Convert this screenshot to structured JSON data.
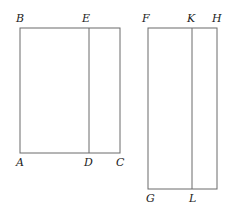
{
  "diagram": {
    "colors": {
      "line": "#6a6a6a",
      "label": "#222222",
      "background": "#ffffff"
    },
    "figure_left": {
      "rectangle": {
        "x1": 20,
        "y1": 28,
        "x2": 120,
        "y2": 153
      },
      "divider": {
        "x": 89,
        "y1": 28,
        "y2": 153
      },
      "labels": {
        "B": "B",
        "E": "E",
        "A": "A",
        "D": "D",
        "C": "C"
      }
    },
    "figure_right": {
      "rectangle": {
        "x1": 148,
        "y1": 28,
        "x2": 217,
        "y2": 189
      },
      "divider": {
        "x": 192,
        "y1": 28,
        "y2": 189
      },
      "labels": {
        "F": "F",
        "K": "K",
        "H": "H",
        "G": "G",
        "L": "L"
      }
    }
  }
}
